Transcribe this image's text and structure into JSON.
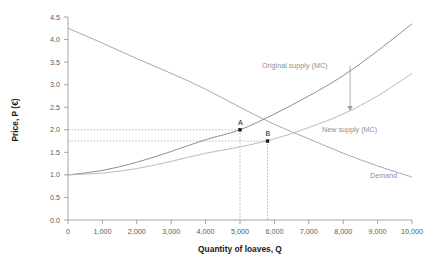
{
  "chart_data": {
    "type": "line",
    "title": "",
    "xlabel": "Quantity of loaves, Q",
    "ylabel": "Price, P (€)",
    "xlim": [
      0,
      10000
    ],
    "ylim": [
      0,
      4.5
    ],
    "xticks": [
      "0",
      "1,000",
      "2,000",
      "3,000",
      "4,000",
      "5,000",
      "6,000",
      "7,000",
      "8,000",
      "9,000",
      "10,000"
    ],
    "xtick_values": [
      0,
      1000,
      2000,
      3000,
      4000,
      5000,
      6000,
      7000,
      8000,
      9000,
      10000
    ],
    "yticks": [
      "0.0",
      "0.5",
      "1.0",
      "1.5",
      "2.0",
      "2.5",
      "3.0",
      "3.5",
      "4.0",
      "4.5"
    ],
    "ytick_values": [
      0,
      0.5,
      1.0,
      1.5,
      2.0,
      2.5,
      3.0,
      3.5,
      4.0,
      4.5
    ],
    "grid": false,
    "legend_position": "inline-annotations",
    "series": [
      {
        "name": "Demand",
        "color": "#a7a9ac",
        "x": [
          0,
          1000,
          2000,
          3000,
          4000,
          5000,
          6000,
          7000,
          8000,
          9000,
          10000
        ],
        "values": [
          4.25,
          3.92,
          3.58,
          3.25,
          2.9,
          2.5,
          2.12,
          1.8,
          1.48,
          1.2,
          0.95
        ]
      },
      {
        "name": "Original supply (MC)",
        "color": "#8c8e90",
        "x": [
          0,
          1000,
          2000,
          3000,
          4000,
          5000,
          6000,
          7000,
          8000,
          9000,
          10000
        ],
        "values": [
          1.0,
          1.1,
          1.28,
          1.52,
          1.78,
          2.0,
          2.35,
          2.75,
          3.2,
          3.75,
          4.35
        ]
      },
      {
        "name": "New supply (MC)",
        "color": "#b9bbbd",
        "x": [
          0,
          1000,
          2000,
          3000,
          4000,
          5000,
          6000,
          7000,
          8000,
          9000,
          10000
        ],
        "values": [
          1.0,
          1.04,
          1.14,
          1.3,
          1.48,
          1.62,
          1.8,
          2.05,
          2.35,
          2.75,
          3.25
        ]
      }
    ],
    "annotations": [
      {
        "name": "A",
        "label": "A",
        "x": 5000,
        "y": 2.0
      },
      {
        "name": "B",
        "label": "B",
        "x": 5800,
        "y": 1.75
      }
    ],
    "guide_lines": [
      {
        "axis": "y",
        "value": 2.0,
        "to_x": 5000
      },
      {
        "axis": "y",
        "value": 1.75,
        "to_x": 5800
      },
      {
        "axis": "x",
        "value": 5000,
        "to_y": 2.0
      },
      {
        "axis": "x",
        "value": 5800,
        "to_y": 1.75
      }
    ],
    "shift_arrow": {
      "name": "supply-shift-arrow",
      "x": 8200,
      "y_from": 3.42,
      "y_to": 2.45,
      "direction": "down"
    },
    "labels": {
      "original_supply": "Original supply (MC)",
      "new_supply": "New supply (MC)",
      "demand": "Demand",
      "point_a": "A",
      "point_b": "B"
    },
    "colors": {
      "demand": "#a7a9ac",
      "original_supply": "#8c8e90",
      "new_supply": "#b9bbbd",
      "axis": "#9a9c9e",
      "text": "#58595b",
      "title_text": "#1a1a1a"
    }
  }
}
